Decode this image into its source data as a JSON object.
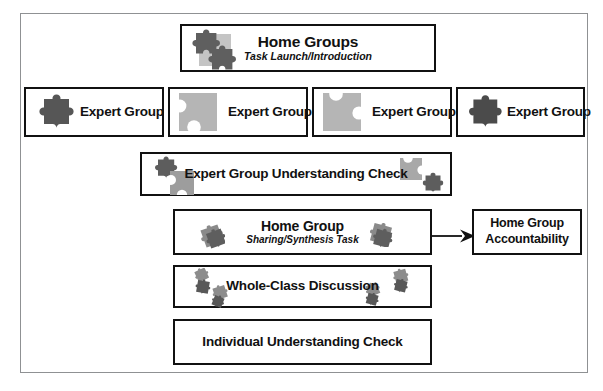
{
  "diagram": {
    "colors": {
      "frame_border": "#8f9193",
      "box_border": "#111111",
      "text": "#111111",
      "puzzle_dark": "#5a5a5a",
      "puzzle_light": "#b8b8b8",
      "puzzle_mid": "#8c8c8c",
      "background": "#ffffff"
    },
    "home_groups": {
      "title": "Home Groups",
      "subtitle": "Task Launch/Introduction",
      "icon": "two-puzzle-pieces-on-square-icon"
    },
    "expert_groups": [
      {
        "label": "Expert Group",
        "icon": "dark-puzzle-piece-icon"
      },
      {
        "label": "Expert Group",
        "icon": "light-puzzle-square-left-blanks-icon"
      },
      {
        "label": "Expert Group",
        "icon": "light-puzzle-square-top-blanks-icon"
      },
      {
        "label": "Expert Group",
        "icon": "dark-puzzle-piece-icon"
      }
    ],
    "expert_understanding_check": {
      "title": "Expert Group Understanding Check",
      "icons": [
        "dark-puzzle-piece-icon",
        "light-puzzle-piece-icon",
        "light-puzzle-piece-icon",
        "dark-puzzle-piece-icon"
      ]
    },
    "home_group": {
      "title": "Home Group",
      "subtitle": "Sharing/Synthesis Task",
      "icons": [
        "small-puzzle-cluster-icon",
        "small-puzzle-cluster-icon"
      ]
    },
    "home_group_accountability": {
      "line1": "Home Group",
      "line2": "Accountability"
    },
    "whole_class_discussion": {
      "title": "Whole-Class Discussion",
      "icons": [
        "scattered-puzzle-pieces-icon"
      ]
    },
    "individual_understanding_check": {
      "title": "Individual Understanding Check"
    },
    "arrow": {
      "name": "flow-arrow-right",
      "from": "home_group",
      "to": "home_group_accountability"
    }
  }
}
